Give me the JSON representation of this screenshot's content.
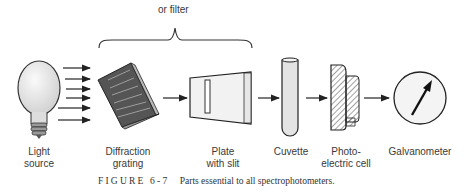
{
  "diagram": {
    "bracket_label": "or filter",
    "components": [
      {
        "id": "light-source",
        "line1": "Light",
        "line2": "source"
      },
      {
        "id": "diffraction-grating",
        "line1": "Diffraction",
        "line2": "grating"
      },
      {
        "id": "plate-with-slit",
        "line1": "Plate",
        "line2": "with slit"
      },
      {
        "id": "cuvette",
        "line1": "Cuvette",
        "line2": ""
      },
      {
        "id": "photoelectric-cell",
        "line1": "Photo-",
        "line2": "electric cell"
      },
      {
        "id": "galvanometer",
        "line1": "Galvanometer",
        "line2": ""
      }
    ],
    "caption": {
      "figure_label": "FIGURE 6-7",
      "text": "Parts essential to all spectrophotometers."
    }
  }
}
